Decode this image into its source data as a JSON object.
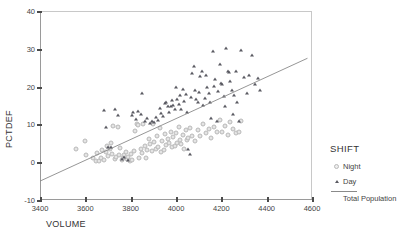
{
  "chart_data": {
    "type": "scatter",
    "title": "",
    "xlabel": "VOLUME",
    "ylabel": "PCTDEF",
    "xlim": [
      3400,
      4600
    ],
    "ylim": [
      -10,
      40
    ],
    "xticks": [
      3400,
      3600,
      3800,
      4000,
      4200,
      4400,
      4600
    ],
    "yticks": [
      -10,
      0,
      10,
      20,
      30,
      40
    ],
    "grid": false,
    "legend_position": "right",
    "legend_title": "SHIFT",
    "series": [
      {
        "name": "Night",
        "marker": "open-circle",
        "color": "#d9d9d9",
        "points": [
          [
            3561,
            3.6
          ],
          [
            3597,
            5.5
          ],
          [
            3603,
            2.0
          ],
          [
            3636,
            1.0
          ],
          [
            3648,
            0.4
          ],
          [
            3652,
            2.4
          ],
          [
            3661,
            0.2
          ],
          [
            3668,
            1.2
          ],
          [
            3674,
            3.1
          ],
          [
            3681,
            0.6
          ],
          [
            3689,
            2.8
          ],
          [
            3694,
            4.4
          ],
          [
            3700,
            1.6
          ],
          [
            3707,
            3.4
          ],
          [
            3712,
            5.0
          ],
          [
            3718,
            2.2
          ],
          [
            3723,
            9.6
          ],
          [
            3730,
            0.8
          ],
          [
            3736,
            1.4
          ],
          [
            3742,
            9.2
          ],
          [
            3748,
            2.0
          ],
          [
            3754,
            3.8
          ],
          [
            3760,
            0.5
          ],
          [
            3766,
            1.0
          ],
          [
            3772,
            1.8
          ],
          [
            3778,
            2.6
          ],
          [
            3784,
            0.9
          ],
          [
            3790,
            1.5
          ],
          [
            3796,
            0.3
          ],
          [
            3802,
            2.1
          ],
          [
            3808,
            0.7
          ],
          [
            3814,
            3.0
          ],
          [
            3820,
            8.3
          ],
          [
            3826,
            10.2
          ],
          [
            3832,
            9.8
          ],
          [
            3838,
            1.2
          ],
          [
            3844,
            3.6
          ],
          [
            3850,
            2.4
          ],
          [
            3856,
            10.0
          ],
          [
            3862,
            4.2
          ],
          [
            3868,
            1.1
          ],
          [
            3874,
            3.2
          ],
          [
            3880,
            6.1
          ],
          [
            3886,
            4.8
          ],
          [
            3892,
            2.9
          ],
          [
            3898,
            10.2
          ],
          [
            3904,
            5.4
          ],
          [
            3910,
            3.5
          ],
          [
            3916,
            6.8
          ],
          [
            3922,
            4.0
          ],
          [
            3928,
            9.0
          ],
          [
            3934,
            2.7
          ],
          [
            3940,
            5.6
          ],
          [
            3946,
            3.3
          ],
          [
            3952,
            7.4
          ],
          [
            3958,
            4.6
          ],
          [
            3964,
            6.2
          ],
          [
            3970,
            5.0
          ],
          [
            3976,
            8.0
          ],
          [
            3982,
            3.9
          ],
          [
            3988,
            6.6
          ],
          [
            3994,
            4.4
          ],
          [
            4000,
            7.8
          ],
          [
            4006,
            5.2
          ],
          [
            4012,
            9.4
          ],
          [
            4018,
            6.0
          ],
          [
            4024,
            4.9
          ],
          [
            4030,
            7.2
          ],
          [
            4036,
            3.4
          ],
          [
            4042,
            8.6
          ],
          [
            4048,
            5.8
          ],
          [
            4054,
            6.4
          ],
          [
            4060,
            9.1
          ],
          [
            4072,
            7.0
          ],
          [
            4084,
            5.6
          ],
          [
            4096,
            8.4
          ],
          [
            4108,
            6.9
          ],
          [
            4120,
            10.0
          ],
          [
            4132,
            7.6
          ],
          [
            4144,
            8.8
          ],
          [
            4156,
            6.3
          ],
          [
            4168,
            9.3
          ],
          [
            4180,
            7.9
          ],
          [
            4192,
            11.2
          ],
          [
            4204,
            8.1
          ],
          [
            4216,
            9.7
          ],
          [
            4228,
            7.3
          ],
          [
            4240,
            10.6
          ],
          [
            4252,
            8.9
          ],
          [
            4264,
            7.8
          ],
          [
            4276,
            8.0
          ],
          [
            4288,
            11.0
          ]
        ]
      },
      {
        "name": "Day",
        "marker": "filled-triangle",
        "color": "#5a5a62",
        "points": [
          [
            3681,
            13.8
          ],
          [
            3692,
            9.2
          ],
          [
            3700,
            3.9
          ],
          [
            3714,
            4.0
          ],
          [
            3732,
            14.2
          ],
          [
            3744,
            12.6
          ],
          [
            3760,
            0.9
          ],
          [
            3772,
            1.4
          ],
          [
            3790,
            0.6
          ],
          [
            3804,
            12.4
          ],
          [
            3812,
            13.2
          ],
          [
            3822,
            11.4
          ],
          [
            3834,
            13.6
          ],
          [
            3844,
            12.8
          ],
          [
            3852,
            18.2
          ],
          [
            3862,
            10.8
          ],
          [
            3872,
            11.6
          ],
          [
            3884,
            10.4
          ],
          [
            3894,
            11.0
          ],
          [
            3904,
            10.6
          ],
          [
            3912,
            12.0
          ],
          [
            3920,
            11.2
          ],
          [
            3928,
            14.4
          ],
          [
            3936,
            13.0
          ],
          [
            3944,
            12.2
          ],
          [
            3952,
            15.6
          ],
          [
            3958,
            16.0
          ],
          [
            3964,
            14.8
          ],
          [
            3970,
            13.4
          ],
          [
            3976,
            15.0
          ],
          [
            3982,
            16.4
          ],
          [
            3988,
            15.2
          ],
          [
            3994,
            14.2
          ],
          [
            4000,
            20.0
          ],
          [
            4006,
            16.8
          ],
          [
            4012,
            15.4
          ],
          [
            4018,
            17.8
          ],
          [
            4024,
            14.0
          ],
          [
            4030,
            19.4
          ],
          [
            4036,
            16.2
          ],
          [
            4042,
            18.0
          ],
          [
            4048,
            13.2
          ],
          [
            4054,
            3.4
          ],
          [
            4060,
            2.2
          ],
          [
            4066,
            17.2
          ],
          [
            4072,
            23.6
          ],
          [
            4078,
            25.4
          ],
          [
            4084,
            19.0
          ],
          [
            4090,
            16.6
          ],
          [
            4096,
            15.8
          ],
          [
            4102,
            18.6
          ],
          [
            4108,
            22.8
          ],
          [
            4114,
            24.0
          ],
          [
            4120,
            15.2
          ],
          [
            4126,
            17.0
          ],
          [
            4132,
            23.2
          ],
          [
            4138,
            19.8
          ],
          [
            4144,
            18.4
          ],
          [
            4150,
            16.0
          ],
          [
            4156,
            11.6
          ],
          [
            4162,
            29.4
          ],
          [
            4168,
            20.2
          ],
          [
            4174,
            22.0
          ],
          [
            4180,
            11.0
          ],
          [
            4186,
            18.8
          ],
          [
            4192,
            26.0
          ],
          [
            4198,
            21.0
          ],
          [
            4204,
            20.6
          ],
          [
            4210,
            17.4
          ],
          [
            4216,
            15.0
          ],
          [
            4222,
            30.2
          ],
          [
            4228,
            24.2
          ],
          [
            4234,
            23.8
          ],
          [
            4240,
            21.6
          ],
          [
            4246,
            19.2
          ],
          [
            4252,
            12.8
          ],
          [
            4258,
            17.8
          ],
          [
            4264,
            24.0
          ],
          [
            4270,
            16.0
          ],
          [
            4276,
            11.0
          ],
          [
            4288,
            29.8
          ],
          [
            4300,
            22.6
          ],
          [
            4312,
            18.4
          ],
          [
            4324,
            23.0
          ],
          [
            4336,
            28.4
          ],
          [
            4348,
            20.6
          ],
          [
            4360,
            22.2
          ],
          [
            4372,
            19.0
          ]
        ]
      }
    ],
    "fit_line": {
      "name": "Total Population",
      "color": "#8a8a8a",
      "x0": 3400,
      "y0": -5.0,
      "x1": 4580,
      "y1": 27.5
    }
  },
  "legend": {
    "title": "SHIFT",
    "items": [
      {
        "label": "Night"
      },
      {
        "label": "Day"
      }
    ],
    "line_label": "Total Population"
  }
}
